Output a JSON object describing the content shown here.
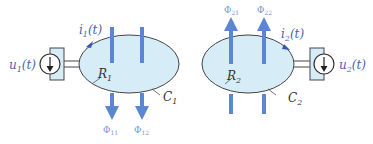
{
  "colors": {
    "fill": "#d6ecf7",
    "outline": "#444444",
    "arrow": "#5b86d4",
    "text_blue": "#4a5fb0",
    "text_dark": "#333333",
    "phi_text": "#7a93d0"
  },
  "circuit1": {
    "source_label": "u",
    "source_sub": "1",
    "source_arg": "(t)",
    "current_label": "i",
    "current_sub": "1",
    "current_arg": "(t)",
    "surface_label": "R",
    "surface_sub": "1",
    "contour_label": "C",
    "contour_sub": "1",
    "flux_labels": [
      {
        "base": "Φ",
        "sub": "11"
      },
      {
        "base": "Φ",
        "sub": "12"
      }
    ]
  },
  "circuit2": {
    "source_label": "u",
    "source_sub": "2",
    "source_arg": "(t)",
    "current_label": "i",
    "current_sub": "2",
    "current_arg": "(t)",
    "surface_label": "R",
    "surface_sub": "2",
    "contour_label": "C",
    "contour_sub": "2",
    "flux_labels": [
      {
        "base": "Φ",
        "sub": "21"
      },
      {
        "base": "Φ",
        "sub": "22"
      }
    ]
  }
}
